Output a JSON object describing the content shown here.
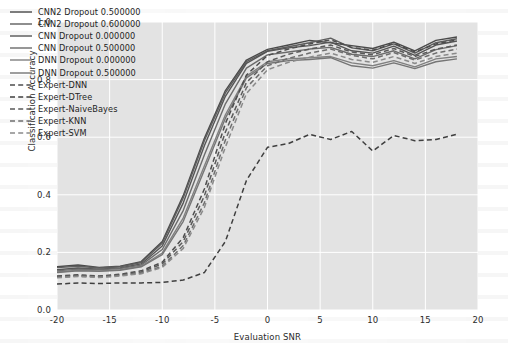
{
  "chart_data": {
    "type": "line",
    "title": "",
    "xlabel": "Evaluation SNR",
    "ylabel": "Classification Accuracy",
    "xlim": [
      -20,
      20
    ],
    "ylim": [
      0.0,
      1.0
    ],
    "xticks": [
      -20,
      -15,
      -10,
      -5,
      0,
      5,
      10,
      15,
      20
    ],
    "xtick_labels": [
      "-20",
      "-15",
      "-10",
      "-5",
      "0",
      "5",
      "10",
      "15",
      "20"
    ],
    "yticks": [
      0.0,
      0.2,
      0.4,
      0.6,
      0.8,
      1.0
    ],
    "ytick_labels": [
      "0.0",
      "0.2",
      "0.4",
      "0.6",
      "0.8",
      "1.0"
    ],
    "grid": true,
    "grid_color": "#ffffff",
    "plot_background": "#e3e3e3",
    "figure_background": "#ffffff",
    "legend_position": "upper left",
    "x": [
      -20,
      -18,
      -16,
      -14,
      -12,
      -10,
      -8,
      -6,
      -4,
      -2,
      0,
      2,
      4,
      6,
      8,
      10,
      12,
      14,
      16,
      18
    ],
    "series": [
      {
        "name": "CNN2 Dropout 0.500000",
        "style": "solid",
        "color": "#4a4a4a",
        "values": [
          0.15,
          0.156,
          0.148,
          0.152,
          0.168,
          0.238,
          0.398,
          0.596,
          0.762,
          0.868,
          0.905,
          0.92,
          0.936,
          0.928,
          0.918,
          0.908,
          0.93,
          0.9,
          0.936,
          0.948
        ]
      },
      {
        "name": "CNN2 Dropout 0.600000",
        "style": "solid",
        "color": "#5e5e5e",
        "values": [
          0.147,
          0.152,
          0.146,
          0.15,
          0.165,
          0.232,
          0.39,
          0.588,
          0.754,
          0.862,
          0.9,
          0.914,
          0.928,
          0.944,
          0.91,
          0.9,
          0.924,
          0.892,
          0.928,
          0.942
        ]
      },
      {
        "name": "CNN Dropout 0.000000",
        "style": "solid",
        "color": "#555555",
        "values": [
          0.14,
          0.146,
          0.142,
          0.146,
          0.16,
          0.222,
          0.372,
          0.57,
          0.742,
          0.856,
          0.898,
          0.91,
          0.918,
          0.93,
          0.9,
          0.892,
          0.916,
          0.884,
          0.92,
          0.934
        ]
      },
      {
        "name": "CNN Dropout 0.500000",
        "style": "solid",
        "color": "#6b6b6b",
        "values": [
          0.136,
          0.142,
          0.14,
          0.144,
          0.156,
          0.21,
          0.346,
          0.538,
          0.716,
          0.84,
          0.886,
          0.896,
          0.906,
          0.912,
          0.888,
          0.88,
          0.9,
          0.872,
          0.904,
          0.918
        ]
      },
      {
        "name": "DNN Dropout 0.000000",
        "style": "solid",
        "color": "#808080",
        "values": [
          0.132,
          0.138,
          0.136,
          0.14,
          0.152,
          0.198,
          0.32,
          0.5,
          0.678,
          0.812,
          0.862,
          0.872,
          0.876,
          0.88,
          0.858,
          0.848,
          0.866,
          0.844,
          0.872,
          0.88
        ]
      },
      {
        "name": "DNN Dropout 0.500000",
        "style": "solid",
        "color": "#757575",
        "values": [
          0.13,
          0.136,
          0.134,
          0.138,
          0.15,
          0.192,
          0.308,
          0.486,
          0.666,
          0.806,
          0.856,
          0.866,
          0.87,
          0.876,
          0.848,
          0.84,
          0.858,
          0.838,
          0.862,
          0.872
        ]
      },
      {
        "name": "Expert-DNN",
        "style": "dashed",
        "color": "#4d4d4d",
        "values": [
          0.118,
          0.122,
          0.118,
          0.124,
          0.136,
          0.166,
          0.252,
          0.42,
          0.648,
          0.816,
          0.884,
          0.906,
          0.924,
          0.938,
          0.912,
          0.902,
          0.926,
          0.896,
          0.924,
          0.938
        ]
      },
      {
        "name": "Expert-DTree",
        "style": "dashed",
        "color": "#3f3f3f",
        "values": [
          0.09,
          0.094,
          0.092,
          0.094,
          0.094,
          0.096,
          0.104,
          0.13,
          0.238,
          0.45,
          0.565,
          0.578,
          0.61,
          0.592,
          0.62,
          0.552,
          0.606,
          0.588,
          0.592,
          0.61
        ]
      },
      {
        "name": "Expert-NaiveBayes",
        "style": "dashed",
        "color": "#5a5a5a",
        "values": [
          0.116,
          0.12,
          0.116,
          0.122,
          0.132,
          0.16,
          0.238,
          0.396,
          0.618,
          0.79,
          0.862,
          0.888,
          0.906,
          0.92,
          0.896,
          0.886,
          0.908,
          0.88,
          0.906,
          0.92
        ]
      },
      {
        "name": "Expert-KNN",
        "style": "dashed",
        "color": "#6e6e6e",
        "values": [
          0.114,
          0.118,
          0.115,
          0.12,
          0.128,
          0.152,
          0.224,
          0.372,
          0.59,
          0.772,
          0.848,
          0.874,
          0.892,
          0.906,
          0.884,
          0.872,
          0.894,
          0.868,
          0.892,
          0.906
        ]
      },
      {
        "name": "Expert-SVM",
        "style": "dashed",
        "color": "#8a8a8a",
        "values": [
          0.112,
          0.116,
          0.113,
          0.118,
          0.126,
          0.148,
          0.214,
          0.356,
          0.566,
          0.752,
          0.834,
          0.86,
          0.878,
          0.892,
          0.87,
          0.86,
          0.88,
          0.856,
          0.88,
          0.892
        ]
      }
    ]
  }
}
